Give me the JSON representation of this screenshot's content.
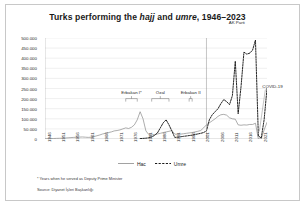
{
  "figure": {
    "title_prefix": "Turks performing the ",
    "title_hajj": "hajj",
    "title_mid": " and ",
    "title_umre": "umre",
    "title_suffix": ", 1946–2023",
    "footnote": "* Years when he served as Deputy Prime Minister",
    "source": "Source:  Diyanet İşleri Başkanlığı",
    "frame_color": "#c8c8c8"
  },
  "legend": {
    "position": "bottom-center",
    "entries": [
      {
        "label": "Hac",
        "style": "solid",
        "color": "#8a8a8a"
      },
      {
        "label": "Umre",
        "style": "dashed",
        "color": "#1a1a1a"
      }
    ]
  },
  "annotations": [
    {
      "name": "erbakan-1",
      "label": "Erbakan I*",
      "x_start": 1974,
      "x_end": 1978,
      "y": 200000
    },
    {
      "name": "ozal",
      "label": "Özal",
      "x_start": 1983,
      "x_end": 1989,
      "y": 200000
    },
    {
      "name": "erbakan-2",
      "label": "Erbakan II",
      "x_start": 1996,
      "x_end": 1997,
      "y": 200000
    },
    {
      "name": "ak-parti",
      "label": "AK Parti",
      "x_start": 2002,
      "x_end": 2023,
      "y": 520000
    },
    {
      "name": "covid-19",
      "label": "COVID-19",
      "x": 2020,
      "y": 255000
    }
  ],
  "chart_data": {
    "type": "line",
    "title": "Turks performing the hajj and umre, 1946–2023",
    "xlabel": "",
    "ylabel": "",
    "xlim": [
      1946,
      2023
    ],
    "ylim": [
      0,
      500000
    ],
    "ytick_step": 50000,
    "grid": "horizontal",
    "yticks": [
      0,
      50000,
      100000,
      150000,
      200000,
      250000,
      300000,
      350000,
      400000,
      450000,
      500000
    ],
    "ytick_labels": [
      "0",
      "50.000",
      "100.000",
      "150.000",
      "200.000",
      "250.000",
      "300.000",
      "350.000",
      "400.000",
      "450.000",
      "500.000"
    ],
    "xticks": [
      1946,
      1951,
      1956,
      1961,
      1966,
      1971,
      1976,
      1981,
      1986,
      1991,
      1996,
      2001,
      2006,
      2011,
      2016,
      2021
    ],
    "xtick_labels": [
      "1946",
      "1951",
      "1956",
      "1961",
      "1966",
      "1971",
      "1976",
      "1981",
      "1986",
      "1991",
      "1996",
      "2001",
      "2006",
      "2011",
      "2016",
      "2021"
    ],
    "x": [
      1946,
      1947,
      1948,
      1949,
      1950,
      1951,
      1952,
      1953,
      1954,
      1955,
      1956,
      1957,
      1958,
      1959,
      1960,
      1961,
      1962,
      1963,
      1964,
      1965,
      1966,
      1967,
      1968,
      1969,
      1970,
      1971,
      1972,
      1973,
      1974,
      1975,
      1976,
      1977,
      1978,
      1979,
      1980,
      1981,
      1982,
      1983,
      1984,
      1985,
      1986,
      1987,
      1988,
      1989,
      1990,
      1991,
      1992,
      1993,
      1994,
      1995,
      1996,
      1997,
      1998,
      1999,
      2000,
      2001,
      2002,
      2003,
      2004,
      2005,
      2006,
      2007,
      2008,
      2009,
      2010,
      2011,
      2012,
      2013,
      2014,
      2015,
      2016,
      2017,
      2018,
      2019,
      2020,
      2021,
      2022,
      2023
    ],
    "series": [
      {
        "name": "Hac",
        "style": "solid",
        "color": "#8a8a8a",
        "values": [
          1000,
          1500,
          2000,
          2500,
          3000,
          3500,
          4000,
          5000,
          6000,
          7000,
          8000,
          9000,
          9500,
          10000,
          9000,
          8000,
          9000,
          12000,
          16000,
          20000,
          25000,
          28000,
          32000,
          35000,
          40000,
          42000,
          45000,
          50000,
          55000,
          52000,
          58000,
          70000,
          95000,
          135000,
          100000,
          40000,
          22000,
          20000,
          22000,
          25000,
          28000,
          32000,
          35000,
          38000,
          42000,
          24000,
          23000,
          24000,
          26000,
          28000,
          30000,
          32000,
          35000,
          38000,
          42000,
          55000,
          70000,
          80000,
          90000,
          100000,
          112000,
          120000,
          122000,
          118000,
          105000,
          100000,
          98000,
          70000,
          68000,
          70000,
          69000,
          72000,
          72000,
          78000,
          0,
          0,
          45000,
          82000
        ]
      },
      {
        "name": "Umre",
        "style": "dashed",
        "color": "#1a1a1a",
        "values": [
          null,
          null,
          null,
          null,
          null,
          null,
          null,
          null,
          null,
          null,
          null,
          null,
          null,
          null,
          null,
          null,
          null,
          null,
          null,
          null,
          null,
          null,
          null,
          null,
          null,
          null,
          null,
          null,
          null,
          null,
          null,
          null,
          null,
          2000,
          3000,
          4000,
          6000,
          10000,
          18000,
          30000,
          55000,
          80000,
          95000,
          70000,
          40000,
          8000,
          9000,
          11000,
          13000,
          15000,
          17000,
          19000,
          22000,
          25000,
          28000,
          32000,
          40000,
          95000,
          120000,
          135000,
          150000,
          175000,
          195000,
          185000,
          170000,
          215000,
          385000,
          125000,
          260000,
          430000,
          420000,
          425000,
          440000,
          490000,
          15000,
          5000,
          95000,
          250000
        ]
      }
    ],
    "annotations": [
      "Erbakan I*",
      "Özal",
      "Erbakan II",
      "AK Parti",
      "COVID-19"
    ]
  }
}
